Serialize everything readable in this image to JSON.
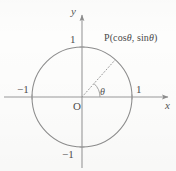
{
  "figure": {
    "kind": "unit-circle-diagram",
    "width": 176,
    "height": 171,
    "background_color": "#fdfdfc",
    "stroke_color": "#8d8d8d",
    "text_color": "#4a4a4a"
  },
  "axes": {
    "x_label": "x",
    "y_label": "y",
    "origin_label": "O"
  },
  "ticks": {
    "y_positive": "1",
    "y_negative": "−1",
    "x_positive": "1",
    "x_negative": "−1"
  },
  "angle": {
    "label": "θ",
    "value_degrees": 48
  },
  "point": {
    "name": "P",
    "open_paren": "(",
    "x_coordinate": "cos",
    "x_symbol": "θ",
    "separator": ",",
    "y_coordinate": "sin",
    "y_symbol": "θ",
    "close_paren": ")",
    "full_label": "P(cos θ,  sin θ)"
  },
  "geometry": {
    "center_x": 82,
    "center_y": 97,
    "radius": 50,
    "point_x": 115,
    "point_y": 60
  }
}
